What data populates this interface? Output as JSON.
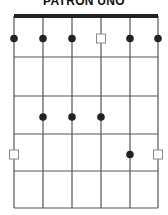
{
  "title": "PATRON UNO",
  "diagram": {
    "type": "guitar-scale-box",
    "strings": 6,
    "frets": 5,
    "string_x": [
      14,
      43,
      72,
      101,
      130,
      158
    ],
    "fret_y": [
      16,
      57,
      96,
      134,
      171,
      208
    ],
    "nut": {
      "y": 14,
      "height": 4,
      "color": "#222222"
    },
    "line_color": "#555555",
    "dot_color": "#222222",
    "square_color": "#888888",
    "markers": [
      {
        "string": 1,
        "fret": 1,
        "shape": "dot"
      },
      {
        "string": 2,
        "fret": 1,
        "shape": "dot"
      },
      {
        "string": 3,
        "fret": 1,
        "shape": "dot"
      },
      {
        "string": 4,
        "fret": 1,
        "shape": "square"
      },
      {
        "string": 5,
        "fret": 1,
        "shape": "dot"
      },
      {
        "string": 6,
        "fret": 1,
        "shape": "dot"
      },
      {
        "string": 2,
        "fret": 3,
        "shape": "dot"
      },
      {
        "string": 3,
        "fret": 3,
        "shape": "dot"
      },
      {
        "string": 4,
        "fret": 3,
        "shape": "dot"
      },
      {
        "string": 1,
        "fret": 4,
        "shape": "square"
      },
      {
        "string": 5,
        "fret": 4,
        "shape": "dot"
      },
      {
        "string": 6,
        "fret": 4,
        "shape": "square"
      }
    ]
  }
}
